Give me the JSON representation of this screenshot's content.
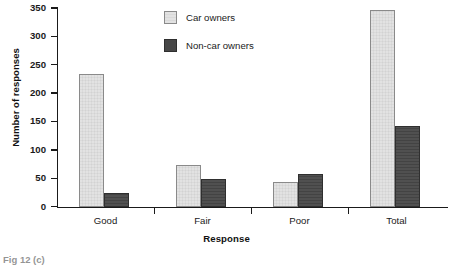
{
  "chart_data": {
    "type": "bar",
    "title": "",
    "xlabel": "Response",
    "ylabel": "Number of responses",
    "categories": [
      "Good",
      "Fair",
      "Poor",
      "Total"
    ],
    "series": [
      {
        "name": "Car owners",
        "values": [
          235,
          74,
          44,
          347
        ],
        "color": "#e2e2e2"
      },
      {
        "name": "Non-car owners",
        "values": [
          24,
          49,
          59,
          142
        ],
        "color": "#474747"
      }
    ],
    "ylim": [
      0,
      350
    ],
    "yticks": [
      0,
      50,
      100,
      150,
      200,
      250,
      300,
      350
    ],
    "ytick_labels": [
      "0",
      "50",
      "100",
      "150",
      "200",
      "250",
      "300",
      "350"
    ],
    "grid": false,
    "legend_position": "top-left-center"
  },
  "legend": {
    "items": [
      {
        "label": "Car owners",
        "swatch": "light-square-swatch"
      },
      {
        "label": "Non-car owners",
        "swatch": "dark-square-swatch"
      }
    ]
  },
  "axes": {
    "y_title": "Number of responses",
    "x_title": "Response"
  },
  "caption": {
    "partial_text": "Fig 12 (c)"
  }
}
